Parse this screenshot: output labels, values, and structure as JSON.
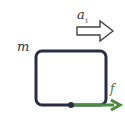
{
  "diagram": {
    "type": "free-body-diagram",
    "labels": {
      "mass": "m",
      "acceleration": "a",
      "acceleration_subscript": "1",
      "friction": "f"
    },
    "colors": {
      "block_stroke": "#2a2d45",
      "friction_arrow": "#4a8a3a",
      "accel_arrow_stroke": "#444444"
    },
    "elements": [
      {
        "name": "block",
        "shape": "rounded-rectangle"
      },
      {
        "name": "acceleration-arrow",
        "shape": "hollow-arrow",
        "direction": "right"
      },
      {
        "name": "friction-arrow",
        "shape": "solid-arrow",
        "direction": "right",
        "origin": "bottom-edge-point"
      }
    ]
  }
}
